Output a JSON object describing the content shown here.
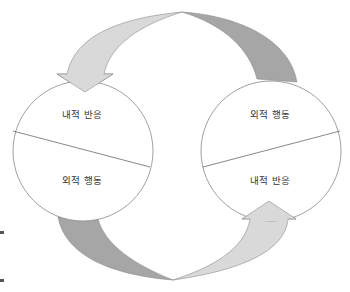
{
  "diagram": {
    "type": "cycle",
    "colors": {
      "light_arrow": "#d9d9d9",
      "dark_band": "#a6a6a6",
      "outline": "#8c8c8c",
      "circle_stroke": "#888888",
      "text": "#333333"
    },
    "left_circle": {
      "top_label": "내적 반응",
      "bottom_label": "외적 행동"
    },
    "right_circle": {
      "top_label": "외적 행동",
      "bottom_label": "내적 반응"
    },
    "connectors": [
      {
        "from": "right_circle",
        "to": "left_circle",
        "position": "top",
        "style": "arrow-light-and-dark-band"
      },
      {
        "from": "left_circle",
        "to": "right_circle",
        "position": "bottom",
        "style": "arrow-light-and-dark-band"
      }
    ]
  }
}
